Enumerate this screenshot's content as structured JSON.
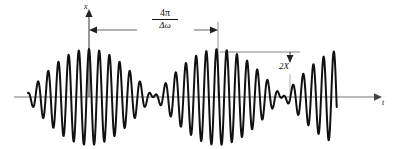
{
  "figure": {
    "kind": "waveform-plot",
    "background_color": "#ffffff",
    "curve_color": "#111111",
    "axis_color": "#777777",
    "annotation_color": "#111111"
  },
  "axes": {
    "vertical_label": "x",
    "horizontal_label": "t",
    "baseline_y": 97,
    "vertical_axis_x": 89,
    "x_start": 14,
    "x_end": 380,
    "y_top": 10
  },
  "annotations": {
    "beat_period": {
      "numerator": "4π",
      "denominator": "Δω",
      "from_x": 89,
      "to_x": 218,
      "dimension_y": 30
    },
    "envelope_amplitude": {
      "label": "2X",
      "leader_from_x": 220,
      "leader_to_x": 300,
      "leader_y": 52,
      "arrow_x": 290
    }
  },
  "chart_data": {
    "type": "line",
    "title": "",
    "xlabel": "t",
    "ylabel": "x",
    "grid": false,
    "legend": null,
    "series": [
      {
        "name": "beat waveform",
        "model": "x(t) = A * cos(pi*(t - 89)/129) * cos(2*pi*(t - 89)/10.2)",
        "carrier_period_px": 10.2,
        "envelope_half_period_px": 129,
        "peak_amplitude_px": 48,
        "antinode_x_px": [
          89,
          218
        ],
        "node_x_px": [
          25,
          154,
          283
        ],
        "curve_start_x_px": 28,
        "curve_end_x_px": 337
      }
    ],
    "xlim": [
      14,
      380
    ],
    "ylim": [
      -52,
      52
    ]
  }
}
